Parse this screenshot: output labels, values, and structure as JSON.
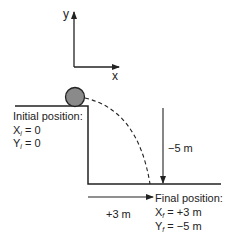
{
  "axes": {
    "x_label": "x",
    "y_label": "y"
  },
  "initial": {
    "title": "Initial position:",
    "x_var": "X",
    "x_sub": "i",
    "x_value": " = 0",
    "y_var": "Y",
    "y_sub": "i",
    "y_value": " = 0"
  },
  "final": {
    "title": "Final position:",
    "x_var": "X",
    "x_sub": "f",
    "x_value": " = +3 m",
    "y_var": "Y",
    "y_sub": "f",
    "y_value": " = −5 m"
  },
  "displacements": {
    "horizontal": "+3 m",
    "vertical": "−5 m"
  },
  "colors": {
    "ball_fill": "#8a8a8a",
    "line": "#222222"
  }
}
